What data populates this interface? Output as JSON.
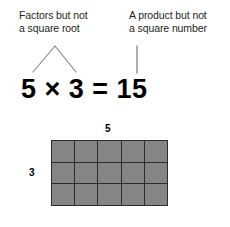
{
  "background_color": "#ffffff",
  "annotations": {
    "left": {
      "text": "Factors but not\na square root",
      "connector": "caret-pointing-to-factors"
    },
    "right": {
      "text": "A product but not\na square number",
      "connector": "vertical-line-pointing-to-product"
    }
  },
  "equation": {
    "text": "5 × 3 = 15",
    "factor_a": "5",
    "operator": "×",
    "factor_b": "3",
    "equals": "=",
    "product": "15"
  },
  "array_diagram": {
    "columns": 5,
    "rows": 3,
    "column_label": "5",
    "row_label": "3",
    "cell_count": 15,
    "cell_fill_color": "#858585",
    "cell_border_color": "#2b2b2b"
  }
}
